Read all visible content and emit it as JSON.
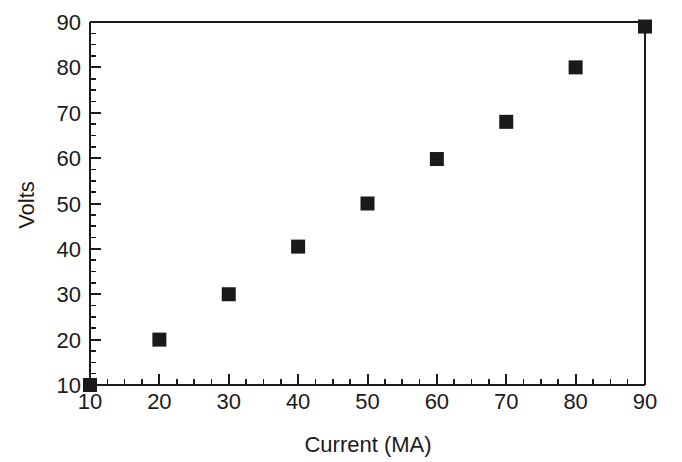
{
  "chart_data": {
    "type": "scatter",
    "title": "",
    "xlabel": "Current (MA)",
    "ylabel": "Volts",
    "xlim": [
      10,
      90
    ],
    "ylim": [
      10,
      90
    ],
    "x_major_tick_step": 10,
    "y_major_tick_step": 10,
    "x_minor_tick_step": 2.5,
    "y_minor_tick_step": 2.5,
    "xticks": [
      10,
      20,
      30,
      40,
      50,
      60,
      70,
      80,
      90
    ],
    "yticks": [
      10,
      20,
      30,
      40,
      50,
      60,
      70,
      80,
      90
    ],
    "xticklabels": [
      "10",
      "20",
      "30",
      "40",
      "50",
      "60",
      "70",
      "80",
      "90"
    ],
    "yticklabels": [
      "10",
      "20",
      "30",
      "40",
      "50",
      "60",
      "70",
      "80",
      "90"
    ],
    "grid": false,
    "legend": false,
    "marker": "square",
    "marker_color": "#1a1a1a",
    "marker_size": 14,
    "series": [
      {
        "name": "measurements",
        "x": [
          10,
          20,
          30,
          40,
          50,
          60,
          70,
          80,
          90
        ],
        "y": [
          10,
          20,
          30,
          40.5,
          50,
          59.8,
          68,
          80,
          89
        ]
      }
    ]
  },
  "style": {
    "background": "#ffffff",
    "axis_color": "#1a1a1a",
    "text_color": "#1a1a1a"
  }
}
